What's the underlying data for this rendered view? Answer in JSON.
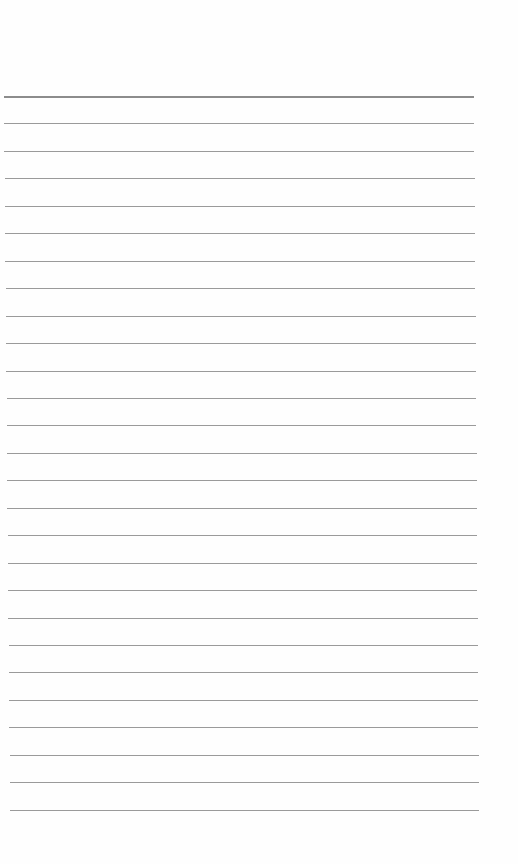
{
  "page": {
    "type": "lined-paper",
    "background": "#fefefe",
    "line_color": "#9a9a9a",
    "header_line_color": "#8c8c8c",
    "line_count": 27,
    "first_line_y": 96,
    "line_spacing": 27.45,
    "left_start_x": 4,
    "left_end_x": 10,
    "right_start_x": 474,
    "right_end_x": 479,
    "text": []
  }
}
